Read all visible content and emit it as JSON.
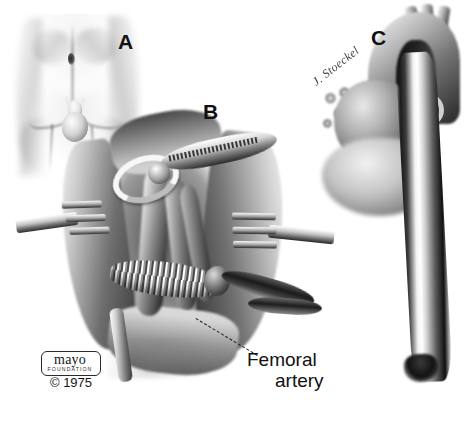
{
  "figure": {
    "medium": "grayscale pen-and-ink / wash medical illustration",
    "background_color": "#ffffff",
    "ink_color": "#111111",
    "width_px": 470,
    "height_px": 423
  },
  "panels": [
    {
      "letter": "A",
      "name": "surface-anatomy",
      "description": "Anterior view of lower abdomen and groin showing umbilicus, inguinal creases, external genitalia and proximal thighs"
    },
    {
      "letter": "B",
      "name": "femoral-exposure",
      "description": "Open groin wound held by self-retaining retractors exposing femoral vessels with vessel loop, vascular clamp, corrugated graft and cannula tubing"
    },
    {
      "letter": "C",
      "name": "aortic-arch",
      "description": "Aortic arch with brachiocephalic branches, heart, lymph nodes and long cannula advanced into the descending aorta"
    }
  ],
  "labels": {
    "femoral_artery": {
      "line1": "Femoral",
      "line2": "artery",
      "leader_style": "dashed"
    }
  },
  "signature": {
    "artist_mark": "J. Stoeckel",
    "style": "cursive italic, rotated"
  },
  "credit": {
    "brand": "mayo",
    "organization": "FOUNDATION",
    "copyright": "© 1975"
  }
}
